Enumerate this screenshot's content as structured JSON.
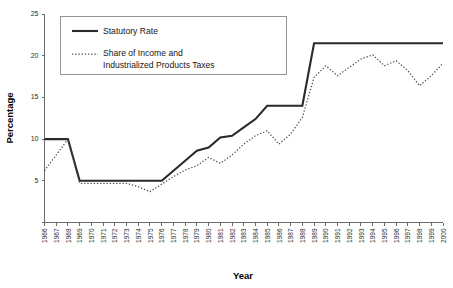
{
  "chart_data": {
    "type": "line",
    "title": "",
    "xlabel": "Year",
    "ylabel": "Percentage",
    "xlim": [
      1966,
      2000
    ],
    "ylim": [
      0,
      25
    ],
    "yticks": [
      0,
      5,
      10,
      15,
      20,
      25
    ],
    "grid": false,
    "legend_position": "top-left inside",
    "x": [
      1966,
      1967,
      1968,
      1969,
      1970,
      1971,
      1972,
      1973,
      1974,
      1975,
      1976,
      1977,
      1978,
      1979,
      1980,
      1981,
      1982,
      1983,
      1984,
      1985,
      1986,
      1987,
      1988,
      1989,
      1990,
      1991,
      1992,
      1993,
      1994,
      1995,
      1996,
      1997,
      1998,
      1999,
      2000
    ],
    "xtick_labels": [
      "1966",
      "1967",
      "1968",
      "1969",
      "1970",
      "1971",
      "1972",
      "1973",
      "1974",
      "1975",
      "1976",
      "1977",
      "1978",
      "1979",
      "1980",
      "1981",
      "1982",
      "1983",
      "1984",
      "1985",
      "1986",
      "1987",
      "1988",
      "1989",
      "1990",
      "1991",
      "1992",
      "1993",
      "1994",
      "1995",
      "1996",
      "1997",
      "1998",
      "1999",
      "2000"
    ],
    "series": [
      {
        "name": "Statutory Rate",
        "style": "solid",
        "color": "#2a2a2a",
        "values": [
          10.0,
          10.0,
          10.0,
          5.0,
          5.0,
          5.0,
          5.0,
          5.0,
          5.0,
          5.0,
          5.0,
          6.2,
          7.4,
          8.6,
          9.0,
          10.2,
          10.4,
          11.4,
          12.4,
          14.0,
          14.0,
          14.0,
          14.0,
          21.5,
          21.5,
          21.5,
          21.5,
          21.5,
          21.5,
          21.5,
          21.5,
          21.5,
          21.5,
          21.5,
          21.5
        ]
      },
      {
        "name": "Share of Income and Industrialized Products Taxes",
        "style": "dotted",
        "color": "#4a4a4a",
        "values": [
          6.2,
          8.1,
          10.0,
          4.7,
          4.7,
          4.7,
          4.7,
          4.7,
          4.3,
          3.7,
          4.6,
          5.5,
          6.3,
          6.8,
          7.8,
          7.1,
          8.1,
          9.4,
          10.4,
          11.0,
          9.4,
          10.6,
          12.6,
          17.4,
          18.8,
          17.6,
          18.6,
          19.6,
          20.1,
          18.8,
          19.4,
          18.2,
          16.4,
          17.6,
          19.1
        ]
      }
    ]
  },
  "legend": {
    "entries": [
      {
        "label": "Statutory Rate"
      },
      {
        "label": "Share of Income and",
        "label2": "Industrialized Products Taxes"
      }
    ]
  },
  "axes": {
    "y_title": "Percentage",
    "x_title": "Year"
  }
}
